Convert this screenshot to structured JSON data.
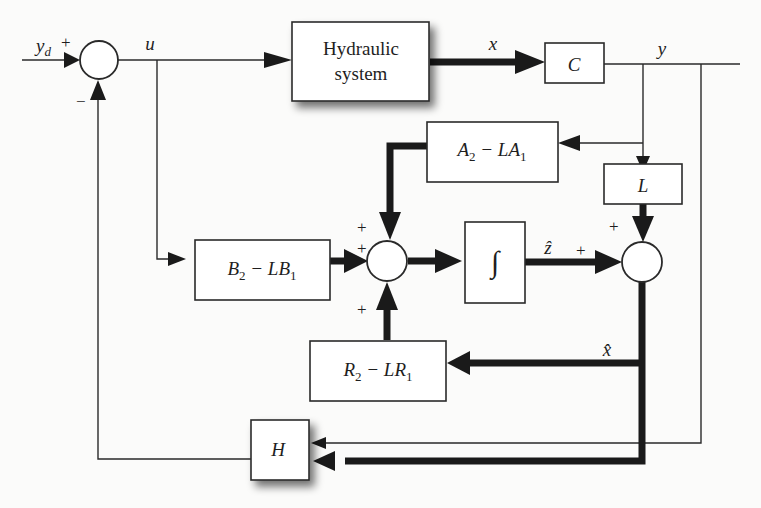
{
  "diagram": {
    "type": "block_diagram",
    "signals": {
      "reference": "y",
      "reference_sub": "d",
      "control": "u",
      "state": "x",
      "output": "y",
      "z_hat": "ẑ",
      "x_hat": "x̂"
    },
    "blocks": {
      "plant": {
        "line1": "Hydraulic",
        "line2": "system"
      },
      "output_matrix": "C",
      "a_block": {
        "t1": "A",
        "s1": "2",
        "t2": " − LA",
        "s2": "1"
      },
      "b_block": {
        "t1": "B",
        "s1": "2",
        "t2": " − LB",
        "s2": "1"
      },
      "r_block": {
        "t1": "R",
        "s1": "2",
        "t2": " − LR",
        "s2": "1"
      },
      "gain_l": "L",
      "integrator": "∫",
      "controller": "H"
    },
    "signs": {
      "sum1_plus": "+",
      "sum1_minus": "−",
      "sum2_top": "+",
      "sum2_left": "+",
      "sum2_bottom": "+",
      "sum3_top": "+",
      "sum3_left": "+"
    }
  }
}
